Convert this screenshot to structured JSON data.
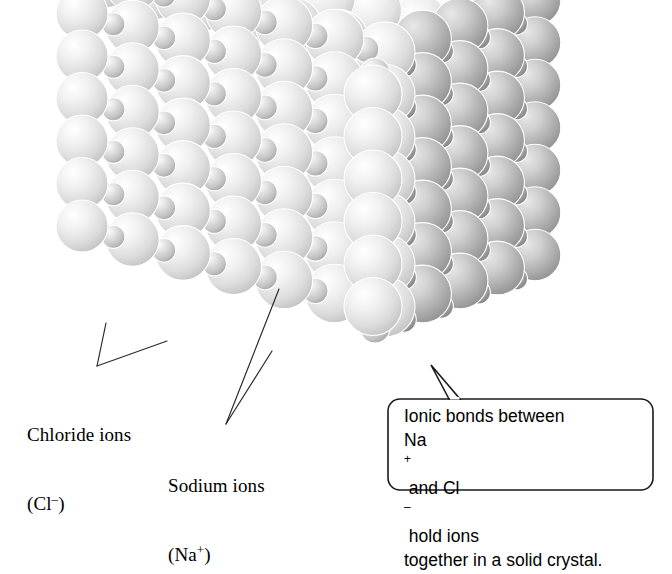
{
  "figure": {
    "background_color": "#ffffff"
  },
  "diagram": {
    "chloride": {
      "name_line": "Chloride ions",
      "formula_line": "(Cl",
      "formula_charge": "–",
      "formula_close": ")",
      "sphere_color": "#dcdcdc",
      "role": "large-light-sphere"
    },
    "sodium": {
      "name_line": "Sodium ions",
      "formula_line": "(Na",
      "formula_charge": "+",
      "formula_close": ")",
      "sphere_color": "#9a9a9a",
      "role": "small-dark-sphere"
    }
  },
  "callout": {
    "line1": "Ionic bonds between",
    "line2_a": "Na",
    "line2_sup": "+",
    "line2_b": " and Cl",
    "line2_sup2": "–",
    "line2_c": " hold ions",
    "line3": "together in a solid crystal.",
    "border_color": "#1a1a1a",
    "fill_color": "#ffffff"
  },
  "leaders": {
    "stroke_color": "#2b2b2b",
    "stroke_width": 1.2
  },
  "crystal": {
    "front_face_tint": "#e3e3e3",
    "right_face_tint": "#a8a8a8",
    "top_face_tint": "#f4f4f4",
    "edge_x": 385,
    "columns_front": 7,
    "columns_right": 5,
    "rows": 7
  }
}
